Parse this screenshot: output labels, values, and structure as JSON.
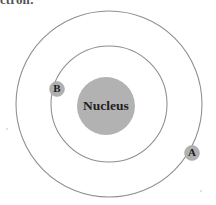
{
  "caption": {
    "text": "ctron:",
    "note": "partially cropped heading text at top edge"
  },
  "diagram": {
    "nucleus": {
      "label": "Nucleus",
      "cx": 106,
      "cy": 106,
      "r": 29,
      "fill": "#b2b2b2"
    },
    "orbits": [
      {
        "name": "outer-orbit",
        "cx": 109,
        "cy": 104,
        "r": 93,
        "stroke": "#8d8d93"
      },
      {
        "name": "inner-orbit",
        "cx": 109,
        "cy": 104,
        "r": 58,
        "stroke": "#8d8d93"
      }
    ],
    "electrons": [
      {
        "label": "B",
        "orbit": "inner-orbit",
        "cx": 57,
        "cy": 89,
        "r": 7.5,
        "fill": "#b0b0b0"
      },
      {
        "label": "A",
        "orbit": "outer-orbit",
        "cx": 192,
        "cy": 153,
        "r": 7.5,
        "fill": "#b0b0b0"
      }
    ]
  },
  "colors": {
    "background": "#ffffff",
    "orbit_stroke": "#8d8d93",
    "nucleus_fill": "#b2b2b2",
    "electron_fill": "#b0b0b0",
    "text": "#23201f"
  }
}
